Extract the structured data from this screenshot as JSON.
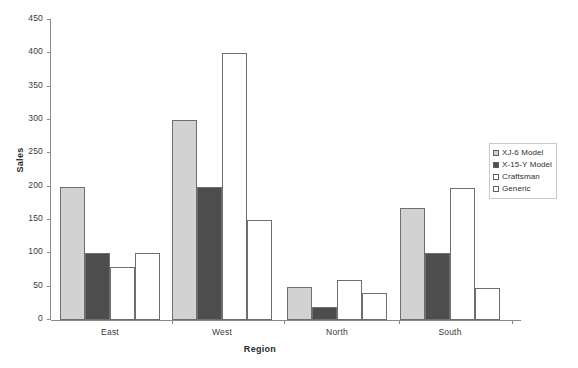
{
  "chart_data": {
    "type": "bar",
    "title": "",
    "xlabel": "Region",
    "ylabel": "Sales",
    "categories": [
      "East",
      "West",
      "North",
      "South"
    ],
    "series": [
      {
        "name": "XJ-6 Model",
        "color": "#d2d2d2",
        "values": [
          200,
          300,
          50,
          168
        ]
      },
      {
        "name": "X-15-Y Model",
        "color": "#4d4d4d",
        "values": [
          100,
          200,
          20,
          100
        ]
      },
      {
        "name": "Craftsman",
        "color": "#ffffff",
        "values": [
          80,
          400,
          60,
          198
        ]
      },
      {
        "name": "Generic",
        "color": "#ffffff",
        "values": [
          100,
          150,
          40,
          48
        ]
      }
    ],
    "ylim": [
      0,
      450
    ],
    "yticks": [
      0,
      50,
      100,
      150,
      200,
      250,
      300,
      350,
      400,
      450
    ],
    "ytick_labels": [
      "0",
      "50",
      "100",
      "150",
      "200",
      "250",
      "300",
      "350",
      "400",
      "450"
    ],
    "grid": false,
    "legend_position": "right",
    "bar_border_color": "#6e6e6e",
    "axis_color": "#8a8a8a"
  },
  "legend": {
    "items": [
      {
        "label": "XJ-6 Model",
        "swatch": "#d2d2d2"
      },
      {
        "label": "X-15-Y Model",
        "swatch": "#4d4d4d"
      },
      {
        "label": "Craftsman",
        "swatch": "#ffffff"
      },
      {
        "label": "Generic",
        "swatch": "#ffffff"
      }
    ]
  }
}
